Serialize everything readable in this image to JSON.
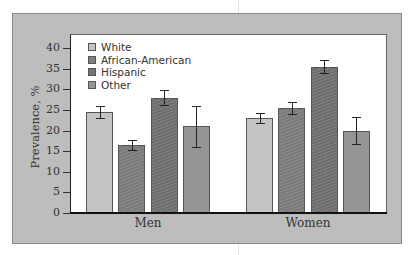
{
  "chart_data": {
    "type": "bar",
    "title": "",
    "xlabel": "",
    "ylabel": "Prevalence, %",
    "ylim": [
      0,
      40
    ],
    "yticks": [
      0,
      5,
      10,
      15,
      20,
      25,
      30,
      35,
      40
    ],
    "categories": [
      "Men",
      "Women"
    ],
    "series": [
      {
        "name": "White",
        "color": "#c4c4c4",
        "values": [
          24.5,
          23.0
        ],
        "error": [
          1.5,
          1.2
        ]
      },
      {
        "name": "African-American",
        "color": "#7a7a7a",
        "values": [
          16.5,
          25.5
        ],
        "error": [
          1.2,
          1.5
        ]
      },
      {
        "name": "Hispanic",
        "color": "#6e6e6e",
        "values": [
          28.0,
          35.5
        ],
        "error": [
          1.8,
          1.5
        ]
      },
      {
        "name": "Other",
        "color": "#959595",
        "values": [
          21.0,
          20.0
        ],
        "error": [
          5.0,
          3.2
        ]
      }
    ],
    "legend_position": "top-left inside",
    "grid": false
  },
  "axis": {
    "ylabel": "Prevalence, %",
    "ticks": [
      "0",
      "5",
      "10",
      "15",
      "20",
      "25",
      "30",
      "35",
      "40"
    ]
  },
  "legend": [
    "White",
    "African-American",
    "Hispanic",
    "Other"
  ],
  "groups": [
    "Men",
    "Women"
  ]
}
